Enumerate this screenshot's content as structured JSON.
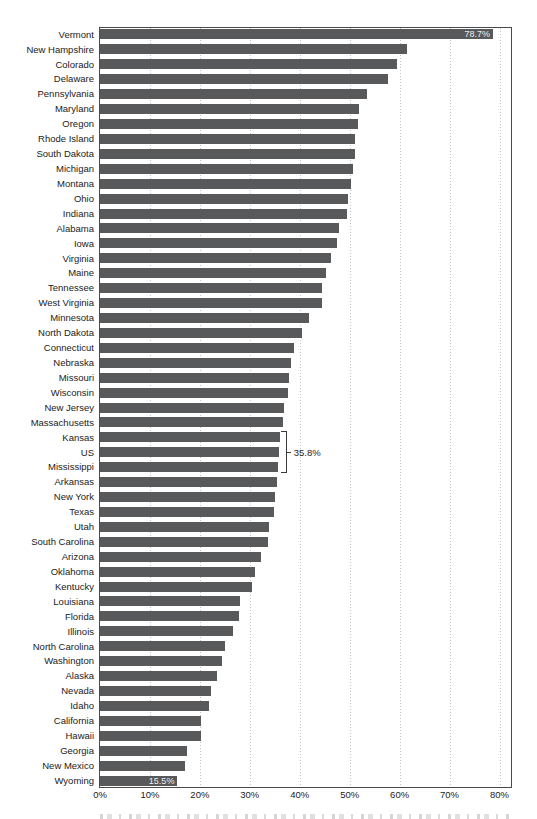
{
  "chart_data": {
    "type": "bar",
    "orientation": "horizontal",
    "title": "",
    "xlabel": "",
    "ylabel": "",
    "x_ticks": [
      "0%",
      "10%",
      "20%",
      "30%",
      "40%",
      "50%",
      "60%",
      "70%",
      "80%"
    ],
    "x_tick_values": [
      0,
      10,
      20,
      30,
      40,
      50,
      60,
      70,
      80
    ],
    "x_range": [
      0,
      80
    ],
    "plot_max": 82.3,
    "grid": "vertical-dotted",
    "legend": "none",
    "bar_color": "#58595b",
    "bar_value_label_color": "#ededed",
    "categories": [
      "Vermont",
      "New Hampshire",
      "Colorado",
      "Delaware",
      "Pennsylvania",
      "Maryland",
      "Oregon",
      "Rhode Island",
      "South Dakota",
      "Michigan",
      "Montana",
      "Ohio",
      "Indiana",
      "Alabama",
      "Iowa",
      "Virginia",
      "Maine",
      "Tennessee",
      "West Virginia",
      "Minnesota",
      "North Dakota",
      "Connecticut",
      "Nebraska",
      "Missouri",
      "Wisconsin",
      "New Jersey",
      "Massachusetts",
      "Kansas",
      "US",
      "Mississippi",
      "Arkansas",
      "New York",
      "Texas",
      "Utah",
      "South Carolina",
      "Arizona",
      "Oklahoma",
      "Kentucky",
      "Louisiana",
      "Florida",
      "Illinois",
      "North Carolina",
      "Washington",
      "Alaska",
      "Nevada",
      "Idaho",
      "California",
      "Hawaii",
      "Georgia",
      "New Mexico",
      "Wyoming"
    ],
    "values": [
      78.7,
      61.5,
      59.4,
      57.6,
      53.4,
      51.9,
      51.6,
      51.1,
      51.0,
      50.6,
      50.2,
      49.6,
      49.5,
      47.9,
      47.4,
      46.3,
      45.3,
      44.5,
      44.4,
      41.9,
      40.5,
      38.8,
      38.3,
      37.8,
      37.6,
      36.8,
      36.6,
      36.1,
      35.8,
      35.7,
      35.4,
      35.1,
      34.9,
      33.8,
      33.7,
      32.3,
      31.1,
      30.4,
      28.1,
      27.9,
      26.7,
      25.0,
      24.4,
      23.4,
      22.3,
      21.9,
      20.3,
      20.2,
      17.4,
      17.0,
      15.5
    ],
    "inside_bar_labels": [
      {
        "category": "Vermont",
        "text": "78.7%"
      },
      {
        "category": "Wyoming",
        "text": "15.5%"
      }
    ],
    "callout": {
      "target": "US",
      "label": "35.8%",
      "span_from": "Kansas",
      "span_to": "Mississippi"
    }
  }
}
